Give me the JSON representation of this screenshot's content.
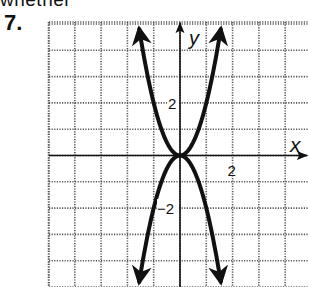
{
  "page": {
    "top_text_fragment": "whether",
    "problem_number": "7."
  },
  "chart_data": {
    "type": "line",
    "title": "",
    "xlabel": "x",
    "ylabel": "y",
    "xlim": [
      -5,
      5
    ],
    "ylim": [
      -5,
      5
    ],
    "grid": true,
    "grid_style": "dotted",
    "tick_labels": {
      "x": [
        {
          "value": 2,
          "label": "2"
        }
      ],
      "y": [
        {
          "value": 2,
          "label": "2"
        },
        {
          "value": -2,
          "label": "−2"
        }
      ]
    },
    "series": [
      {
        "name": "y = 2x²",
        "equation": "y = 2x^2",
        "x": [
          -1.58,
          -1.5,
          -1,
          -0.5,
          0,
          0.5,
          1,
          1.5,
          1.58
        ],
        "y": [
          5,
          4.5,
          2,
          0.5,
          0,
          0.5,
          2,
          4.5,
          5
        ]
      },
      {
        "name": "y = −2x²",
        "equation": "y = -2x^2",
        "x": [
          -1.58,
          -1.5,
          -1,
          -0.5,
          0,
          0.5,
          1,
          1.5,
          1.58
        ],
        "y": [
          -5,
          -4.5,
          -2,
          -0.5,
          0,
          -0.5,
          -2,
          -4.5,
          -5
        ]
      }
    ],
    "legend": null,
    "colors": {
      "curve": "#111111",
      "grid": "#555555",
      "axis": "#111111"
    }
  }
}
